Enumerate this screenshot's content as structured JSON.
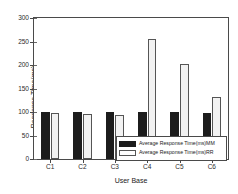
{
  "chart_data": {
    "type": "bar",
    "title": "",
    "xlabel": "User Base",
    "ylabel": "Response Time(ms)",
    "categories": [
      "C1",
      "C2",
      "C3",
      "C4",
      "C5",
      "C6"
    ],
    "ylim": [
      0,
      300
    ],
    "yticks": [
      0,
      50,
      100,
      150,
      200,
      250,
      300
    ],
    "ytick_labels": [
      "0",
      "50",
      "100",
      "150",
      "200",
      "250",
      "300"
    ],
    "grid": false,
    "legend_position": "lower right",
    "series": [
      {
        "name": "Average Response Time(ms)MM",
        "color": "#1c1c1c",
        "values": [
          99,
          101,
          99,
          99,
          100,
          98
        ]
      },
      {
        "name": "Average Response Time(ms)RR",
        "color": "#f2f2f2",
        "values": [
          97,
          95,
          93,
          256,
          203,
          133
        ]
      }
    ]
  },
  "legend": {
    "entries": [
      {
        "label": "Average Response Time(ms)MM"
      },
      {
        "label": "Average Response Time(ms)RR"
      }
    ]
  }
}
